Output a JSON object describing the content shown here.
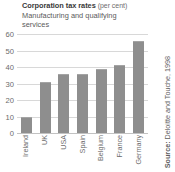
{
  "chart_data": {
    "type": "bar",
    "title": "Corporation tax rates (per cent)",
    "title_main": "Corporation tax rates",
    "title_unit": "(per cent)",
    "subtitle_line1": "Manufacturing and qualifying",
    "subtitle_line2": "services",
    "xlabel": "",
    "ylabel": "",
    "categories": [
      "Ireland",
      "UK",
      "USA",
      "Spain",
      "Belgium",
      "France",
      "Germany"
    ],
    "values": [
      10,
      31,
      36,
      36,
      39,
      41,
      56
    ],
    "ylim": [
      0,
      60
    ],
    "yticks": [
      0,
      10,
      20,
      30,
      40,
      50,
      60
    ],
    "ytick_labels": [
      "0",
      "10",
      "20",
      "30",
      "40",
      "50",
      "60"
    ],
    "grid": true,
    "legend": "none",
    "source": "Source: Deloitte and Touche, 1998",
    "source_prefix": "Source:",
    "source_body": "Deloitte and Touche, 1998",
    "colors": {
      "bar": "#8e8e8e",
      "grid": "#d8d8d8",
      "text": "#6b6b6b",
      "title": "#3a3a3a",
      "background": "#ffffff"
    }
  }
}
